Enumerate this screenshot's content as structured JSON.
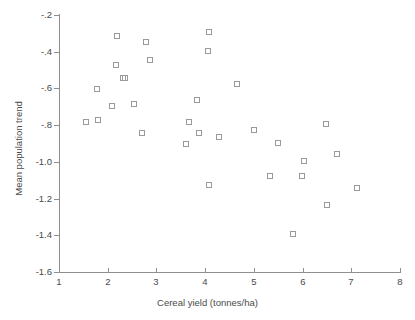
{
  "chart_data": {
    "type": "scatter",
    "title": "",
    "xlabel": "Cereal yield (tonnes/ha)",
    "ylabel": "Mean population trend",
    "xlim": [
      1,
      8
    ],
    "ylim": [
      -1.6,
      -0.2
    ],
    "xticks": [
      "1",
      "2",
      "3",
      "4",
      "5",
      "6",
      "7",
      "8"
    ],
    "xtick_values": [
      1,
      2,
      3,
      4,
      5,
      6,
      7,
      8
    ],
    "yticks": [
      "-.2",
      "-.4",
      "-.6",
      "-.8",
      "-1.0",
      "-1.2",
      "-1.4",
      "-1.6"
    ],
    "ytick_values": [
      -0.2,
      -0.4,
      -0.6,
      -0.8,
      -1.0,
      -1.2,
      -1.4,
      -1.6
    ],
    "grid": false,
    "legend": null,
    "marker": "open-square",
    "marker_color": "#9a9a9a",
    "points": [
      {
        "x": 1.58,
        "y": -0.79
      },
      {
        "x": 1.8,
        "y": -0.61
      },
      {
        "x": 1.83,
        "y": -0.78
      },
      {
        "x": 2.1,
        "y": -0.7
      },
      {
        "x": 2.21,
        "y": -0.32
      },
      {
        "x": 2.19,
        "y": -0.48
      },
      {
        "x": 2.33,
        "y": -0.55
      },
      {
        "x": 2.37,
        "y": -0.55
      },
      {
        "x": 2.56,
        "y": -0.69
      },
      {
        "x": 2.72,
        "y": -0.85
      },
      {
        "x": 2.8,
        "y": -0.35
      },
      {
        "x": 2.88,
        "y": -0.45
      },
      {
        "x": 3.62,
        "y": -0.91
      },
      {
        "x": 3.68,
        "y": -0.79
      },
      {
        "x": 3.86,
        "y": -0.67
      },
      {
        "x": 3.9,
        "y": -0.85
      },
      {
        "x": 4.07,
        "y": -0.4
      },
      {
        "x": 4.1,
        "y": -0.3
      },
      {
        "x": 4.1,
        "y": -1.13
      },
      {
        "x": 4.3,
        "y": -0.87
      },
      {
        "x": 4.68,
        "y": -0.58
      },
      {
        "x": 5.03,
        "y": -0.83
      },
      {
        "x": 5.36,
        "y": -1.08
      },
      {
        "x": 5.52,
        "y": -0.9
      },
      {
        "x": 5.82,
        "y": -1.4
      },
      {
        "x": 6.0,
        "y": -1.08
      },
      {
        "x": 6.05,
        "y": -1.0
      },
      {
        "x": 6.5,
        "y": -0.8
      },
      {
        "x": 6.52,
        "y": -1.24
      },
      {
        "x": 6.72,
        "y": -0.96
      },
      {
        "x": 7.13,
        "y": -1.15
      }
    ]
  }
}
